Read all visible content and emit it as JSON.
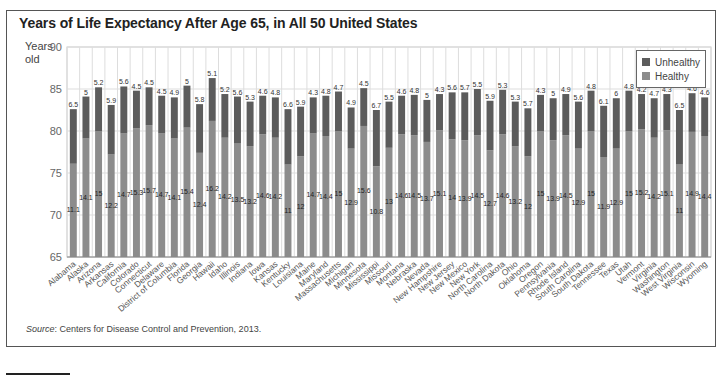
{
  "title": "Years of Life Expectancy After Age 65, in All 50 United States",
  "ylabel": "Years old",
  "source_prefix": "Source",
  "source_text": ": Centers for Disease Control and Prevention, 2013.",
  "legend": {
    "unhealthy_label": "Unhealthy",
    "healthy_label": "Healthy"
  },
  "colors": {
    "unhealthy": "#5c5c5c",
    "healthy": "#8c8c8c",
    "grid": "#dddddd",
    "axis": "#888888"
  },
  "chart_data": {
    "type": "bar",
    "stacked": true,
    "title": "Years of Life Expectancy After Age 65, in All 50 United States",
    "xlabel": "",
    "ylabel": "Years old",
    "ylim": [
      65,
      90
    ],
    "yticks": [
      65,
      70,
      75,
      80,
      85,
      90
    ],
    "baseline": 65,
    "grid": true,
    "legend_position": "top-right",
    "categories": [
      "Alabama",
      "Alaska",
      "Arizona",
      "Arkansas",
      "California",
      "Colorado",
      "Connecticut",
      "Delaware",
      "District of Columbia",
      "Florida",
      "Georgia",
      "Hawaii",
      "Idaho",
      "Illinois",
      "Indiana",
      "Iowa",
      "Kansas",
      "Kentucky",
      "Louisiana",
      "Maine",
      "Maryland",
      "Massachusetts",
      "Michigan",
      "Minnesota",
      "Mississippi",
      "Missouri",
      "Montana",
      "Nebraska",
      "Nevada",
      "New Hampshire",
      "New Jersey",
      "New Mexico",
      "New York",
      "North Carolina",
      "North Dakota",
      "Ohio",
      "Oklahoma",
      "Oregon",
      "Pennsylvania",
      "Rhode Island",
      "South Carolina",
      "South Dakota",
      "Tennessee",
      "Texas",
      "Utah",
      "Vermont",
      "Virginia",
      "Washington",
      "West Virginia",
      "Wisconsin",
      "Wyoming"
    ],
    "series": [
      {
        "name": "Healthy",
        "values": [
          11.1,
          14.1,
          15,
          12.2,
          14.7,
          15.3,
          15.7,
          14.7,
          14.1,
          15.4,
          12.4,
          16.2,
          14.2,
          13.5,
          13.2,
          14.6,
          14.2,
          11,
          12,
          14.7,
          14.4,
          15,
          12.9,
          15.6,
          10.8,
          13,
          14.6,
          14.5,
          13.7,
          15.1,
          14,
          13.9,
          14.5,
          12.7,
          14.6,
          13.2,
          12,
          15,
          13.9,
          14.5,
          12.9,
          15,
          11.9,
          12.9,
          15,
          15.2,
          14.2,
          15.1,
          11,
          14.9,
          14.4
        ]
      },
      {
        "name": "Unhealthy",
        "values": [
          6.5,
          5,
          5.2,
          5.9,
          5.6,
          4.5,
          4.5,
          4.5,
          4.9,
          5,
          5.8,
          5.1,
          5.2,
          5.6,
          5.3,
          4.6,
          4.8,
          6.6,
          5.9,
          4.3,
          4.8,
          4.7,
          4.9,
          4.5,
          6.7,
          5.5,
          4.6,
          4.8,
          5,
          4.3,
          5.6,
          5.7,
          5.5,
          5.9,
          5.3,
          5.3,
          5.7,
          4.3,
          5,
          4.9,
          5.6,
          4.8,
          6.1,
          6,
          4.8,
          4.2,
          4.7,
          4.3,
          6.5,
          4.6,
          4.6
        ]
      }
    ]
  }
}
